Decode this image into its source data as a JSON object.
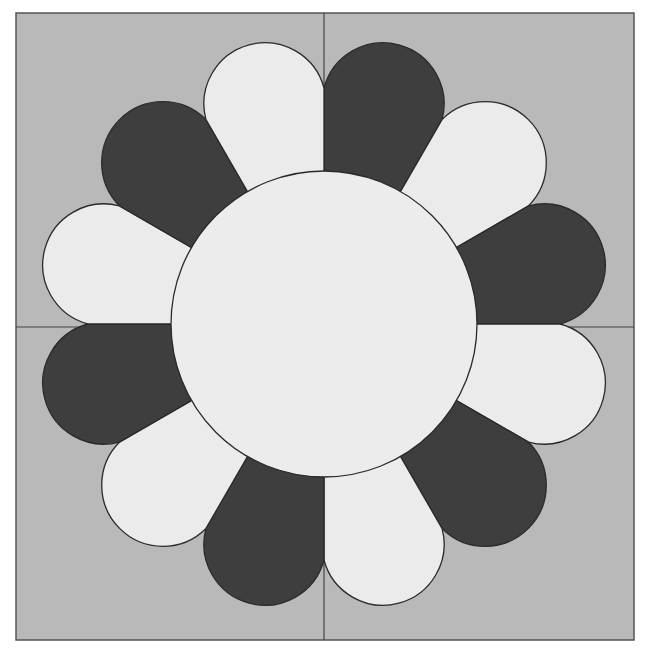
{
  "pattern": {
    "name": "Dresden plate quilt block",
    "colors": {
      "page": "#ffffff",
      "background": "#b9b9b9",
      "light_petal": "#ebebeb",
      "dark_petal": "#3e3e3e",
      "center": "#ececec",
      "outline": "#2a2a2a"
    },
    "frame": {
      "x": 16,
      "y": 13,
      "width": 618,
      "height": 627
    },
    "divider_lines": {
      "vertical_x": 324,
      "horizontal_y": 327
    },
    "center": {
      "cx": 324,
      "cy": 324,
      "radius": 153
    },
    "petal_count": 12,
    "petal_geometry": {
      "cap_center_distance": 228,
      "cap_radius": 62
    },
    "petals": [
      {
        "angle": 15,
        "tone": "dark"
      },
      {
        "angle": 45,
        "tone": "light"
      },
      {
        "angle": 75,
        "tone": "dark"
      },
      {
        "angle": 105,
        "tone": "light"
      },
      {
        "angle": 135,
        "tone": "dark"
      },
      {
        "angle": 165,
        "tone": "light"
      },
      {
        "angle": 195,
        "tone": "dark"
      },
      {
        "angle": 225,
        "tone": "light"
      },
      {
        "angle": 255,
        "tone": "dark"
      },
      {
        "angle": 285,
        "tone": "light"
      },
      {
        "angle": 315,
        "tone": "dark"
      },
      {
        "angle": 345,
        "tone": "light"
      }
    ]
  }
}
